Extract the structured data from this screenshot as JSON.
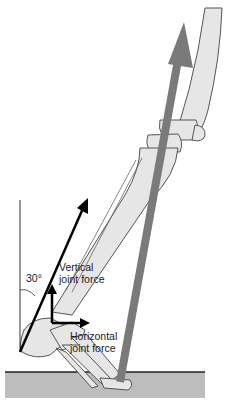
{
  "diagram": {
    "angle_label": "30°",
    "vertical_force": {
      "line1": "Vertical",
      "line2": "joint force"
    },
    "horizontal_force": {
      "line1": "Horizontal",
      "line2": "joint force"
    }
  },
  "colors": {
    "bone_fill": "#e6e6e6",
    "bone_outline": "#555555",
    "force_arrow": "#7a7a7a",
    "ground": "#bdbdbd",
    "black_arrow": "#000000"
  }
}
